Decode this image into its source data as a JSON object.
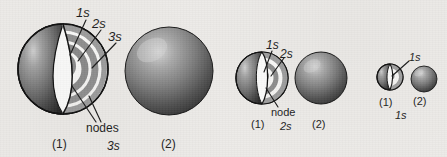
{
  "figure": {
    "title": "",
    "background_color": "#eceae7",
    "ink_color": "#1d1d1d"
  },
  "groups": [
    {
      "id": "group-3s",
      "orbital_label": "3s",
      "cutaway": {
        "panel_label": "(1)",
        "shell_labels": [
          "1s",
          "2s",
          "3s"
        ],
        "node_label": "nodes",
        "node_count": 2,
        "shells": 3
      },
      "solid": {
        "panel_label": "(2)"
      }
    },
    {
      "id": "group-2s",
      "orbital_label": "2s",
      "cutaway": {
        "panel_label": "(1)",
        "shell_labels": [
          "1s",
          "2s"
        ],
        "node_label": "node",
        "node_count": 1,
        "shells": 2
      },
      "solid": {
        "panel_label": "(2)"
      }
    },
    {
      "id": "group-1s",
      "orbital_label": "1s",
      "cutaway": {
        "panel_label": "(1)",
        "shell_labels": [
          "1s"
        ],
        "node_label": "",
        "node_count": 0,
        "shells": 1
      },
      "solid": {
        "panel_label": "(2)"
      }
    }
  ],
  "labels": {
    "g1_1s": "1s",
    "g1_2s": "2s",
    "g1_3s": "3s",
    "g1_nodes": "nodes",
    "g1_panel1": "(1)",
    "g1_panel2": "(2)",
    "g1_orbital": "3s",
    "g2_1s": "1s",
    "g2_2s": "2s",
    "g2_node": "node",
    "g2_panel1": "(1)",
    "g2_panel2": "(2)",
    "g2_orbital": "2s",
    "g3_1s": "1s",
    "g3_panel1": "(1)",
    "g3_panel2": "(2)",
    "g3_orbital": "1s"
  },
  "colors": {
    "sphere_dark": "#2b2b2b",
    "sphere_mid": "#6b6b6b",
    "sphere_light": "#c9c9c9",
    "ring_gray": "#9a9a9a",
    "cut_face": "#fbfbfa",
    "outline": "#101010"
  }
}
